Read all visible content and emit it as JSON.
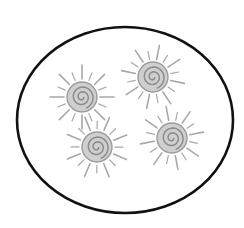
{
  "scene": {
    "description": "Hand-drawn oval containing four gray sun shapes with spiral centers",
    "background": "#ffffff",
    "ellipse": {
      "cx": 125,
      "cy": 120,
      "rx": 108,
      "ry": 93,
      "stroke": "#111111",
      "stroke_width": 2.6
    },
    "sun_style": {
      "core_fill": "#cfcfcf",
      "core_stroke": "#9a9a9a",
      "spiral_stroke": "#8c8c8c",
      "ray_stroke": "#a8a8a8"
    },
    "suns": [
      {
        "name": "sun-top-left",
        "cx": 82,
        "cy": 97,
        "r": 15
      },
      {
        "name": "sun-top-right",
        "cx": 153,
        "cy": 77,
        "r": 15
      },
      {
        "name": "sun-bottom-left",
        "cx": 97,
        "cy": 147,
        "r": 15
      },
      {
        "name": "sun-bottom-right",
        "cx": 172,
        "cy": 138,
        "r": 15
      }
    ]
  }
}
